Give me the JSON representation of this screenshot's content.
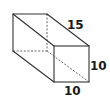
{
  "figure": {
    "type": "rectangular-prism",
    "dimensions": {
      "length": "15",
      "height": "10",
      "width": "10"
    },
    "labels": {
      "length_label": "15",
      "height_label": "10",
      "width_label": "10"
    },
    "colors": {
      "edge": "#333333",
      "hidden_edge": "#555555",
      "label": "#1a1a1a",
      "background": "#ffffff"
    }
  }
}
